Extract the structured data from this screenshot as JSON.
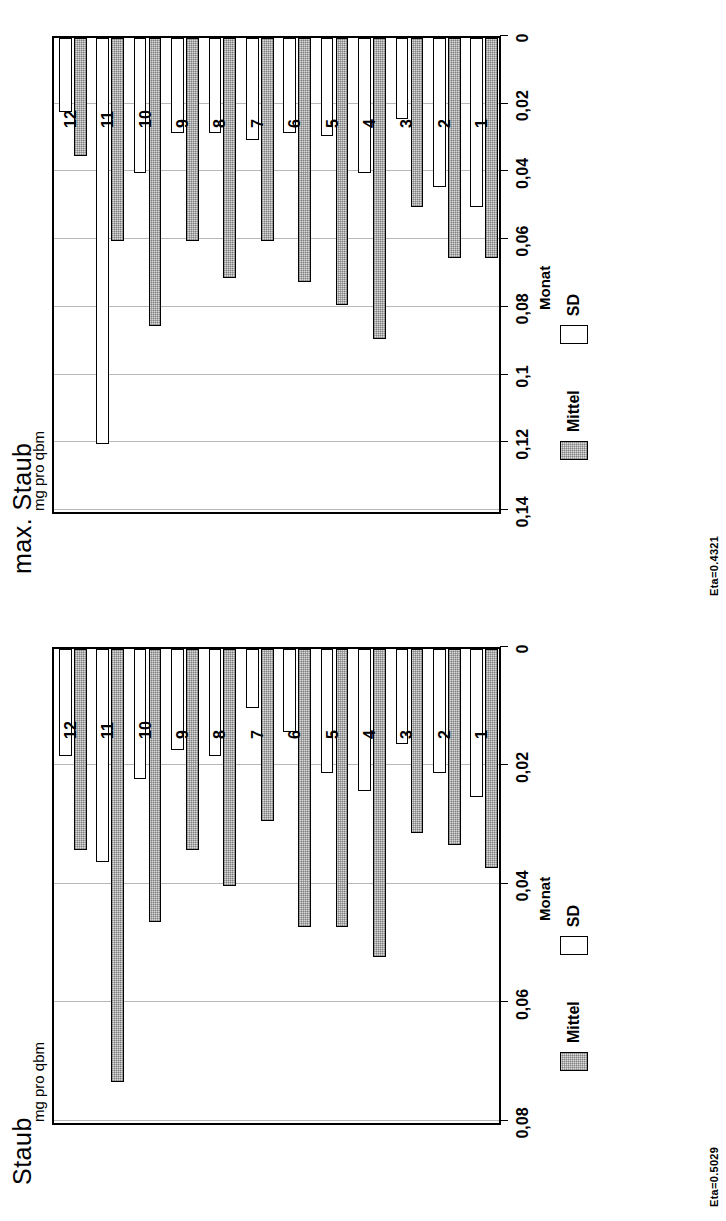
{
  "page": {
    "figure_count": 2
  },
  "charts": [
    {
      "id": "max-staub",
      "title": "max. Staub",
      "ylabel": "mg pro qbm",
      "xlabel": "Monat",
      "eta": "Eta=0.4321",
      "legend": [
        {
          "key": "mittel",
          "label": "Mittel"
        },
        {
          "key": "sd",
          "label": "SD"
        }
      ],
      "ticks": [
        "0,14",
        "0,12",
        "0,1",
        "0,08",
        "0,06",
        "0,04",
        "0,02",
        "0"
      ],
      "chart_data": {
        "type": "bar",
        "title": "max. Staub",
        "xlabel": "Monat",
        "ylabel": "mg pro qbm",
        "categories": [
          "1",
          "2",
          "3",
          "4",
          "5",
          "6",
          "7",
          "8",
          "9",
          "10",
          "11",
          "12"
        ],
        "series": [
          {
            "name": "Mittel",
            "values": [
              0.065,
              0.065,
              0.05,
              0.089,
              0.079,
              0.072,
              0.06,
              0.071,
              0.06,
              0.085,
              0.06,
              0.035
            ]
          },
          {
            "name": "SD",
            "values": [
              0.05,
              0.044,
              0.024,
              0.04,
              0.029,
              0.028,
              0.03,
              0.028,
              0.028,
              0.04,
              0.12,
              0.022
            ]
          }
        ],
        "ylim": [
          0,
          0.14
        ],
        "tick_values": [
          0.14,
          0.12,
          0.1,
          0.08,
          0.06,
          0.04,
          0.02,
          0
        ],
        "tick_labels": [
          "0,14",
          "0,12",
          "0,1",
          "0,08",
          "0,06",
          "0,04",
          "0,02",
          "0"
        ],
        "grid": true,
        "orientation": "horizontal",
        "legend_position": "bottom",
        "annotation": "Eta=0.4321"
      }
    },
    {
      "id": "staub",
      "title": "Staub",
      "ylabel": "mg pro qbm",
      "xlabel": "Monat",
      "eta": "Eta=0.5029",
      "legend": [
        {
          "key": "mittel",
          "label": "Mittel"
        },
        {
          "key": "sd",
          "label": "SD"
        }
      ],
      "ticks": [
        "0,08",
        "0,06",
        "0,04",
        "0,02",
        "0"
      ],
      "chart_data": {
        "type": "bar",
        "title": "Staub",
        "xlabel": "Monat",
        "ylabel": "mg pro qbm",
        "categories": [
          "1",
          "2",
          "3",
          "4",
          "5",
          "6",
          "7",
          "8",
          "9",
          "10",
          "11",
          "12"
        ],
        "series": [
          {
            "name": "Mittel",
            "values": [
              0.037,
              0.033,
              0.031,
              0.052,
              0.047,
              0.047,
              0.029,
              0.04,
              0.034,
              0.046,
              0.073,
              0.034
            ]
          },
          {
            "name": "SD",
            "values": [
              0.025,
              0.021,
              0.016,
              0.024,
              0.021,
              0.014,
              0.01,
              0.018,
              0.017,
              0.022,
              0.036,
              0.018
            ]
          }
        ],
        "ylim": [
          0,
          0.08
        ],
        "tick_values": [
          0.08,
          0.06,
          0.04,
          0.02,
          0
        ],
        "tick_labels": [
          "0,08",
          "0,06",
          "0,04",
          "0,02",
          "0"
        ],
        "grid": true,
        "orientation": "horizontal",
        "legend_position": "bottom",
        "annotation": "Eta=0.5029"
      }
    }
  ]
}
